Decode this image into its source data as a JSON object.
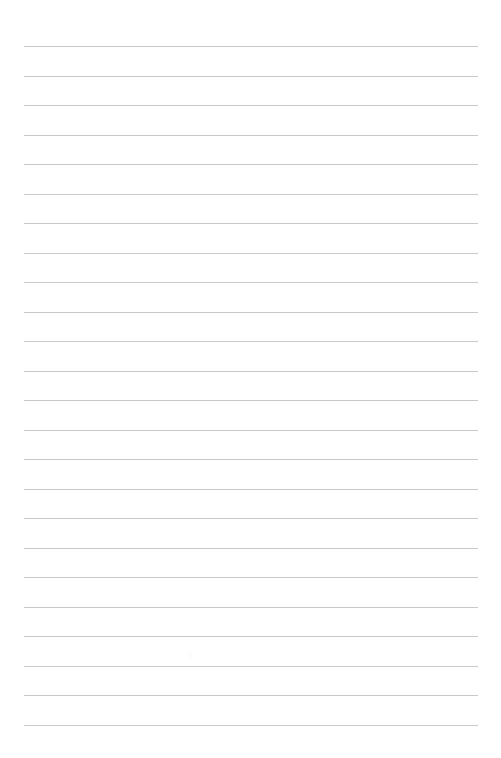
{
  "page": {
    "kind": "ruled-paper-sheet",
    "width": 501,
    "height": 758,
    "background_color": "#ffffff",
    "title": "",
    "body_text": "",
    "heading_text": "",
    "has_margin_rule": false,
    "has_holes": false
  },
  "rules": {
    "count": 24,
    "color": "#c9c9cd",
    "thickness_px": 1,
    "left_x": 24,
    "right_x": 478,
    "length_px": 454,
    "first_y": 46,
    "spacing_px": 29.5,
    "last_y": 724,
    "y_positions": [
      46,
      75.5,
      105,
      134.5,
      164,
      193.5,
      223,
      252.5,
      282,
      311.5,
      341,
      370.5,
      400,
      429.5,
      459,
      488.5,
      518,
      547.5,
      577,
      606.5,
      636,
      665.5,
      695,
      724.5
    ]
  },
  "margins": {
    "top_px": 46,
    "left_px": 24,
    "right_px": 23,
    "bottom_px": 33
  },
  "marks": [
    {
      "x": 188,
      "y": 652,
      "color": "#fcfcfd"
    }
  ]
}
